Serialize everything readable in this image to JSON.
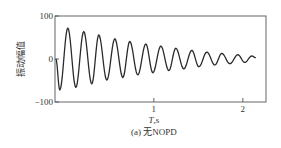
{
  "chart_data": {
    "type": "line",
    "title": "",
    "caption": "(a) 无NOPD",
    "xlabel": "T,s",
    "ylabel": "振动幅值",
    "xlim": [
      -0.11,
      2.26
    ],
    "ylim": [
      -100,
      100
    ],
    "xticks": [
      1,
      2
    ],
    "xtick_labels": [
      "1",
      "2"
    ],
    "yticks": [
      100,
      0,
      -100
    ],
    "ytick_labels": [
      "100",
      "0",
      "−100"
    ],
    "grid": false,
    "legend": null,
    "series": [
      {
        "name": "vibration amplitude (decaying oscillation)",
        "color": "#2a2a2a",
        "x": [
          -0.1,
          -0.056,
          0.034,
          0.124,
          0.213,
          0.303,
          0.382,
          0.472,
          0.562,
          0.652,
          0.73,
          0.82,
          0.91,
          0.989,
          1.079,
          1.169,
          1.247,
          1.337,
          1.427,
          1.506,
          1.596,
          1.685,
          1.764,
          1.854,
          1.944,
          2.022,
          2.101,
          2.146
        ],
        "y": [
          0,
          -72,
          72,
          -66,
          64,
          -58,
          56,
          -49,
          47,
          -43,
          41,
          -37,
          35,
          -32,
          30,
          -27,
          25,
          -23,
          20,
          -18,
          16,
          -14,
          13,
          -11,
          10,
          -8,
          7,
          3
        ]
      }
    ]
  }
}
